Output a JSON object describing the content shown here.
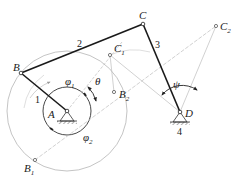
{
  "diagram": {
    "type": "crank-rocker four-bar linkage",
    "colors": {
      "link": "#1a1a1a",
      "construction": "#b0b0b0",
      "text": "#222222"
    },
    "points": {
      "A": {
        "label": "A",
        "x": 67,
        "y": 111
      },
      "B": {
        "label": "B",
        "x": 21,
        "y": 73
      },
      "C": {
        "label": "C",
        "x": 143,
        "y": 24
      },
      "D": {
        "label": "D",
        "x": 180,
        "y": 112
      },
      "C1": {
        "label": "C",
        "sub": "1",
        "x": 110,
        "y": 55
      },
      "C2": {
        "label": "C",
        "sub": "2",
        "x": 216,
        "y": 26
      },
      "B1": {
        "label": "B",
        "sub": "1",
        "x": 35,
        "y": 160
      },
      "B2": {
        "label": "B",
        "sub": "2",
        "x": 114,
        "y": 92
      }
    },
    "links": [
      {
        "number": "1",
        "from": "A",
        "to": "B"
      },
      {
        "number": "2",
        "from": "B",
        "to": "C"
      },
      {
        "number": "3",
        "from": "C",
        "to": "D"
      },
      {
        "number": "4",
        "frame": "D"
      }
    ],
    "angles": {
      "phi1": {
        "symbol": "φ",
        "sub": "1"
      },
      "phi2": {
        "symbol": "φ",
        "sub": "2"
      },
      "theta": {
        "symbol": "θ"
      },
      "psi": {
        "symbol": "ψ"
      }
    }
  }
}
